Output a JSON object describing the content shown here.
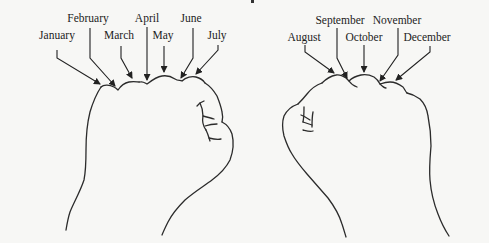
{
  "diagram": {
    "type": "knuckle-month-mnemonic",
    "colors": {
      "background": "#f7f7f5",
      "line": "#2a2a2a",
      "text": "#1c1c1c"
    },
    "left_fist": {
      "labels": [
        {
          "month": "January",
          "x": 57,
          "y": 28
        },
        {
          "month": "February",
          "x": 88,
          "y": 12
        },
        {
          "month": "March",
          "x": 119,
          "y": 29
        },
        {
          "month": "April",
          "x": 147,
          "y": 12
        },
        {
          "month": "May",
          "x": 163,
          "y": 29
        },
        {
          "month": "June",
          "x": 191,
          "y": 12
        },
        {
          "month": "July",
          "x": 217,
          "y": 29
        }
      ]
    },
    "right_fist": {
      "labels": [
        {
          "month": "August",
          "x": 304,
          "y": 31
        },
        {
          "month": "September",
          "x": 340,
          "y": 14
        },
        {
          "month": "October",
          "x": 364,
          "y": 31
        },
        {
          "month": "November",
          "x": 397,
          "y": 14
        },
        {
          "month": "December",
          "x": 427,
          "y": 31
        }
      ]
    }
  }
}
